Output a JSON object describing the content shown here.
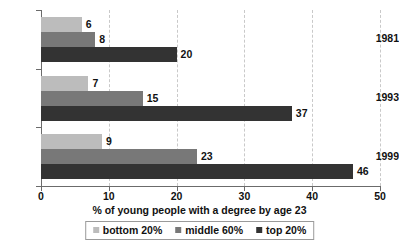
{
  "chart_data": {
    "type": "bar",
    "orientation": "horizontal",
    "title": "",
    "xlabel": "% of young people with a degree by age 23",
    "ylabel": "",
    "xlim": [
      0,
      50
    ],
    "xticks": [
      "0",
      "10",
      "20",
      "30",
      "40",
      "50"
    ],
    "grid": true,
    "grid_axis": "x",
    "legend_position": "bottom",
    "categories": [
      "1981",
      "1993",
      "1999"
    ],
    "series": [
      {
        "name": "bottom 20%",
        "color": "#bcbcbc",
        "values": [
          6,
          7,
          9
        ]
      },
      {
        "name": "middle 60%",
        "color": "#787878",
        "values": [
          8,
          15,
          23
        ]
      },
      {
        "name": "top 20%",
        "color": "#333333",
        "values": [
          20,
          37,
          46
        ]
      }
    ],
    "data_labels": [
      [
        "6",
        "8",
        "20"
      ],
      [
        "7",
        "15",
        "37"
      ],
      [
        "9",
        "23",
        "46"
      ]
    ]
  },
  "legend": {
    "items": [
      {
        "label": "bottom 20%"
      },
      {
        "label": "middle 60%"
      },
      {
        "label": "top 20%"
      }
    ]
  }
}
